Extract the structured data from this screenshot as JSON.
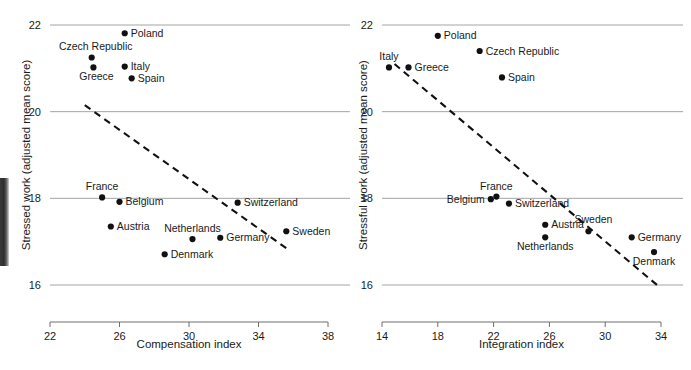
{
  "figure": {
    "background": "#ffffff",
    "point_color": "#111111",
    "gridline_color": "#9a9a9a",
    "trendline_color": "#111111"
  },
  "chart_data": [
    {
      "type": "scatter",
      "title": "",
      "xlabel": "Compensation index",
      "ylabel": "Stressed work (adjusted mean score)",
      "xlim": [
        22,
        38
      ],
      "ylim": [
        15.6,
        22.2
      ],
      "xticks": [
        22,
        26,
        30,
        34,
        38
      ],
      "yticks": [
        22,
        20,
        18,
        16
      ],
      "xtick_labels": [
        "22",
        "26",
        "30",
        "34",
        "38"
      ],
      "ytick_labels": [
        "22",
        "20",
        "18",
        "16"
      ],
      "grid": "horizontal",
      "legend": "none",
      "points": [
        {
          "label": "Poland",
          "x": 26.3,
          "y": 21.81,
          "label_pos": "right"
        },
        {
          "label": "Czech Republic",
          "x": 24.4,
          "y": 21.25,
          "label_pos": "above-left"
        },
        {
          "label": "Italy",
          "x": 26.3,
          "y": 21.04,
          "label_pos": "right"
        },
        {
          "label": "Greece",
          "x": 24.5,
          "y": 21.02,
          "label_pos": "below-right"
        },
        {
          "label": "Spain",
          "x": 26.7,
          "y": 20.77,
          "label_pos": "right"
        },
        {
          "label": "France",
          "x": 25.0,
          "y": 18.02,
          "label_pos": "above"
        },
        {
          "label": "Belgium",
          "x": 26.0,
          "y": 17.92,
          "label_pos": "right"
        },
        {
          "label": "Switzerland",
          "x": 32.8,
          "y": 17.9,
          "label_pos": "right"
        },
        {
          "label": "Austria",
          "x": 25.5,
          "y": 17.35,
          "label_pos": "right"
        },
        {
          "label": "Netherlands",
          "x": 30.2,
          "y": 17.06,
          "label_pos": "above"
        },
        {
          "label": "Germany",
          "x": 31.8,
          "y": 17.09,
          "label_pos": "right"
        },
        {
          "label": "Sweden",
          "x": 35.6,
          "y": 17.24,
          "label_pos": "right"
        },
        {
          "label": "Denmark",
          "x": 28.6,
          "y": 16.71,
          "label_pos": "right"
        }
      ],
      "trendline": {
        "x0": 24.0,
        "y0": 20.15,
        "x1": 35.6,
        "y1": 16.85
      }
    },
    {
      "type": "scatter",
      "title": "",
      "xlabel": "Integration index",
      "ylabel": "Stressful work (adjusted mean score)",
      "xlim": [
        14,
        34
      ],
      "ylim": [
        15.6,
        22.2
      ],
      "xticks": [
        14,
        18,
        22,
        26,
        30,
        34
      ],
      "yticks": [
        22,
        20,
        18,
        16
      ],
      "xtick_labels": [
        "14",
        "18",
        "22",
        "26",
        "30",
        "34"
      ],
      "ytick_labels": [
        "22",
        "20",
        "18",
        "16"
      ],
      "grid": "horizontal",
      "legend": "none",
      "points": [
        {
          "label": "Poland",
          "x": 18.0,
          "y": 21.75,
          "label_pos": "right"
        },
        {
          "label": "Czech Republic",
          "x": 21.0,
          "y": 21.4,
          "label_pos": "right"
        },
        {
          "label": "Italy",
          "x": 14.5,
          "y": 21.02,
          "label_pos": "above"
        },
        {
          "label": "Greece",
          "x": 15.9,
          "y": 21.02,
          "label_pos": "right"
        },
        {
          "label": "Spain",
          "x": 22.6,
          "y": 20.79,
          "label_pos": "right"
        },
        {
          "label": "Belgium",
          "x": 21.8,
          "y": 17.98,
          "label_pos": "left"
        },
        {
          "label": "France",
          "x": 22.2,
          "y": 18.04,
          "label_pos": "above"
        },
        {
          "label": "Switzerland",
          "x": 23.1,
          "y": 17.88,
          "label_pos": "right"
        },
        {
          "label": "Austria",
          "x": 25.7,
          "y": 17.39,
          "label_pos": "right"
        },
        {
          "label": "Netherlands",
          "x": 25.7,
          "y": 17.1,
          "label_pos": "below"
        },
        {
          "label": "Sweden",
          "x": 28.8,
          "y": 17.24,
          "label_pos": "above-right"
        },
        {
          "label": "Germany",
          "x": 31.9,
          "y": 17.1,
          "label_pos": "right"
        },
        {
          "label": "Denmark",
          "x": 33.5,
          "y": 16.76,
          "label_pos": "below"
        }
      ],
      "trendline": {
        "x0": 14.9,
        "y0": 21.1,
        "x1": 33.9,
        "y1": 15.95
      }
    }
  ]
}
